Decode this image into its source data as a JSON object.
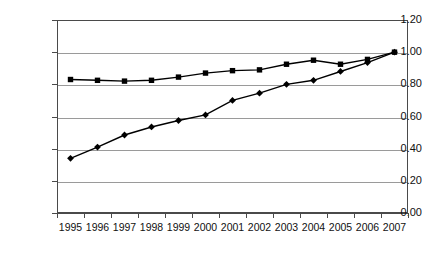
{
  "chart_data": {
    "type": "line",
    "title": "",
    "subtitle": "",
    "xlabel": "",
    "ylabel": "",
    "categories": [
      "1995",
      "1996",
      "1997",
      "1998",
      "1999",
      "2000",
      "2001",
      "2002",
      "2003",
      "2004",
      "2005",
      "2006",
      "2007"
    ],
    "ylim": [
      0.0,
      1.2
    ],
    "ytick_labels": [
      "1.20",
      "1.00",
      "0.80",
      "0.60",
      "0.40",
      "0.20",
      "0.00"
    ],
    "ytick_values": [
      1.2,
      1.0,
      0.8,
      0.6,
      0.4,
      0.2,
      0.0
    ],
    "grid": true,
    "grid_axis": "y",
    "legend": "none",
    "series": [
      {
        "name": "series-squares",
        "marker": "square",
        "color": "#000000",
        "values": [
          0.83,
          0.825,
          0.82,
          0.825,
          0.845,
          0.87,
          0.885,
          0.89,
          0.925,
          0.95,
          0.925,
          0.955,
          1.0
        ]
      },
      {
        "name": "series-diamonds",
        "marker": "diamond",
        "color": "#000000",
        "values": [
          0.34,
          0.41,
          0.485,
          0.535,
          0.575,
          0.61,
          0.7,
          0.745,
          0.8,
          0.825,
          0.88,
          0.935,
          1.0
        ]
      }
    ]
  },
  "colors": {
    "axis": "#4a4a4a",
    "gridline": "#9a9a9a",
    "series": "#000000",
    "background": "#ffffff",
    "text": "#111111"
  }
}
